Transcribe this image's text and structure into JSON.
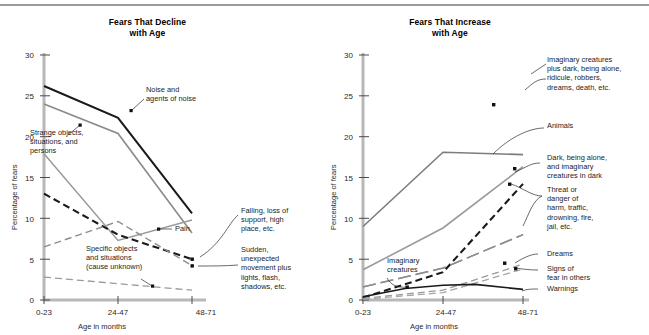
{
  "figure": {
    "ylabel": "Percentage of fears",
    "xlabel": "Age in months",
    "yticks": [
      "0",
      "5",
      "10",
      "15",
      "20",
      "25",
      "30"
    ],
    "xticks": [
      "0-23",
      "24-47",
      "48-71"
    ],
    "ylim": [
      0,
      30
    ]
  },
  "panels": {
    "left": {
      "title_line1": "Fears That Decline",
      "title_line2": "with Age",
      "annotations": {
        "noise": "Noise and\nagents of noise",
        "strange": "Strange objects,\nsituations, and\npersons",
        "specific": "Specific objects\nand situations\n(cause unknown)",
        "pain": "Pain",
        "falling": "Falling, loss of\nsupport, high\nplace, etc.",
        "sudden": "Sudden,\nunexpected\nmovement plus\nlights, flash,\nshadows, etc."
      }
    },
    "right": {
      "title_line1": "Fears That Increase",
      "title_line2": "with Age",
      "annotations": {
        "imaginary_plus": "Imaginary creatures\nplus dark, being alone,\nridicule, robbers,\ndreams, death, etc.",
        "animals": "Animals",
        "dark": "Dark, being alone,\nand imaginary\ncreatures in dark",
        "threat": "Threat or\ndanger of\nharm, traffic,\ndrowning, fire,\njail, etc.",
        "dreams": "Dreams",
        "signs": "Signs of\nfear in others",
        "warnings": "Warnings",
        "imaginary_creatures": "Imaginary\ncreatures"
      }
    }
  },
  "chart_data": [
    {
      "id": "fears-that-decline-with-age",
      "type": "line",
      "title": "Fears That Decline with Age",
      "xlabel": "Age in months",
      "ylabel": "Percentage of fears",
      "categories": [
        "0-23",
        "24-47",
        "48-71"
      ],
      "ylim": [
        0,
        30
      ],
      "grid": false,
      "legend": "annotations-on-plot",
      "series": [
        {
          "name": "Noise and agents of noise",
          "values": [
            26.2,
            22.3,
            10.6
          ],
          "style": "solid",
          "color": "#1a1a1a",
          "width": 2.0
        },
        {
          "name": "Strange objects, situations, and persons",
          "values": [
            24.0,
            20.4,
            8.2
          ],
          "style": "solid",
          "color": "#8a8a8a",
          "width": 1.6
        },
        {
          "name": "Pain",
          "values": [
            17.9,
            7.3,
            9.8
          ],
          "style": "solid",
          "color": "#9a9a9a",
          "width": 1.5
        },
        {
          "name": "Falling, loss of support, high place, etc.",
          "values": [
            13.0,
            8.0,
            5.0
          ],
          "style": "dashed",
          "color": "#1a1a1a",
          "width": 2.0
        },
        {
          "name": "Sudden, unexpected movement plus lights, flash, shadows, etc.",
          "values": [
            6.5,
            9.6,
            4.2
          ],
          "style": "dashed",
          "color": "#8d8d8d",
          "width": 1.3
        },
        {
          "name": "Specific objects and situations (cause unknown)",
          "values": [
            2.8,
            2.0,
            1.2
          ],
          "style": "dashed",
          "color": "#9a9a9a",
          "width": 1.3
        }
      ]
    },
    {
      "id": "fears-that-increase-with-age",
      "type": "line",
      "title": "Fears That Increase with Age",
      "xlabel": "Age in months",
      "ylabel": "Percentage of fears",
      "categories": [
        "0-23",
        "24-47",
        "48-71"
      ],
      "ylim": [
        0,
        30
      ],
      "grid": false,
      "legend": "annotations-on-plot",
      "series": [
        {
          "name": "Imaginary creatures plus dark, being alone, ridicule, robbers, dreams, death, etc.",
          "values": [
            4.8,
            11.6,
            28.2
          ],
          "style": "solid",
          "color": "#1a1a1a",
          "width": 2.0
        },
        {
          "name": "Animals",
          "values": [
            9.0,
            18.1,
            17.8
          ],
          "style": "solid",
          "color": "#7d7d7d",
          "width": 1.6
        },
        {
          "name": "Dark, being alone, and imaginary creatures in dark",
          "values": [
            3.7,
            8.8,
            16.3
          ],
          "style": "solid",
          "color": "#9a9a9a",
          "width": 1.5
        },
        {
          "name": "Threat or danger of harm, traffic, drowning, fire, jail, etc.",
          "values": [
            0.3,
            3.4,
            14.2
          ],
          "style": "dashed",
          "color": "#1a1a1a",
          "width": 2.0
        },
        {
          "name": "Imaginary creatures",
          "values": [
            1.6,
            3.9,
            8.0
          ],
          "style": "dashed-long",
          "color": "#8d8d8d",
          "width": 1.4
        },
        {
          "name": "Dreams",
          "values": [
            0.2,
            1.2,
            4.4
          ],
          "style": "dashed",
          "color": "#9a9a9a",
          "width": 1.3
        },
        {
          "name": "Signs of fear in others",
          "values": [
            0.1,
            0.9,
            3.8
          ],
          "style": "dashed",
          "color": "#a5a5a5",
          "width": 1.3
        },
        {
          "name": "Warnings",
          "values": [
            0.4,
            1.9,
            1.3
          ],
          "style": "solid",
          "color": "#1a1a1a",
          "width": 1.5
        }
      ]
    }
  ]
}
